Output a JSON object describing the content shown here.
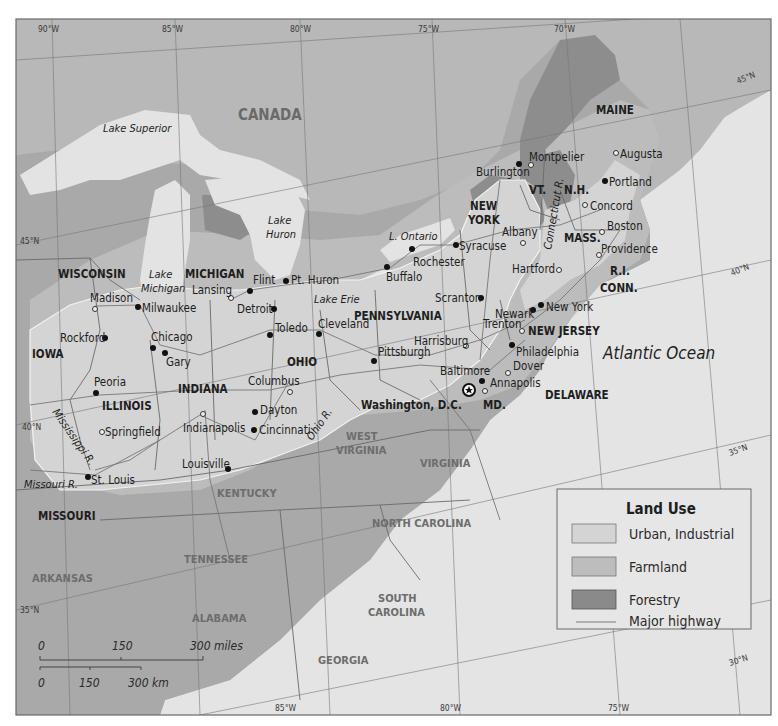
{
  "colors": {
    "land_canada": "#b7b7b7",
    "land_us": "#a9a9a9",
    "water": "#e3e3e3",
    "urban_industrial": "#d4d4d4",
    "farmland": "#bdbdbd",
    "forestry": "#8a8a8a",
    "highway": "#7a7a7a",
    "border": "#555555"
  },
  "grid_labels": {
    "top": [
      "90°W",
      "85°W",
      "80°W",
      "75°W",
      "70°W"
    ],
    "bottom": [
      "85°W",
      "80°W",
      "75°W"
    ],
    "lat_left": [
      "45°N",
      "40°N",
      "35°N"
    ],
    "lat_right": [
      "45°N",
      "40°N",
      "35°N",
      "30°N"
    ]
  },
  "regions": {
    "country": "CANADA",
    "ocean": "Atlantic Ocean"
  },
  "water_labels": {
    "lake_superior": "Lake Superior",
    "lake_huron_1": "Lake",
    "lake_huron_2": "Huron",
    "lake_michigan_1": "Lake",
    "lake_michigan_2": "Michigan",
    "lake_erie": "Lake Erie",
    "lake_ontario": "L. Ontario",
    "mississippi": "Mississippi R.",
    "missouri": "Missouri R.",
    "ohio": "Ohio R.",
    "connecticut": "Connecticut R."
  },
  "states": {
    "maine": "MAINE",
    "vt": "VT.",
    "nh": "N.H.",
    "new_york_1": "NEW",
    "new_york_2": "YORK",
    "mass": "MASS.",
    "ri": "R.I.",
    "conn": "CONN.",
    "wisconsin": "WISCONSIN",
    "michigan": "MICHIGAN",
    "pennsylvania": "PENNSYLVANIA",
    "new_jersey": "NEW JERSEY",
    "iowa": "IOWA",
    "ohio": "OHIO",
    "indiana": "INDIANA",
    "illinois": "ILLINOIS",
    "md": "MD.",
    "delaware": "DELAWARE",
    "west_virginia_1": "WEST",
    "west_virginia_2": "VIRGINIA",
    "virginia": "VIRGINIA",
    "kentucky": "KENTUCKY",
    "missouri": "MISSOURI",
    "north_carolina": "NORTH CAROLINA",
    "tennessee": "TENNESSEE",
    "arkansas": "ARKANSAS",
    "south_carolina_1": "SOUTH",
    "south_carolina_2": "CAROLINA",
    "alabama": "ALABAMA",
    "georgia": "GEORGIA"
  },
  "cities": {
    "montpelier": "Montpelier",
    "augusta": "Augusta",
    "burlington": "Burlington",
    "portland": "Portland",
    "concord": "Concord",
    "albany": "Albany",
    "boston": "Boston",
    "syracuse": "Syracuse",
    "rochester": "Rochester",
    "providence": "Providence",
    "buffalo": "Buffalo",
    "hartford": "Hartford",
    "flint": "Flint",
    "pt_huron": "Pt. Huron",
    "madison": "Madison",
    "lansing": "Lansing",
    "milwaukee": "Milwaukee",
    "detroit": "Detroit",
    "scranton": "Scranton",
    "newark": "Newark",
    "new_york": "New York",
    "trenton": "Trenton",
    "toledo": "Toledo",
    "cleveland": "Cleveland",
    "rockford": "Rockford",
    "chicago": "Chicago",
    "gary": "Gary",
    "harrisburg": "Harrisburg",
    "philadelphia": "Philadelphia",
    "pittsburgh": "Pittsburgh",
    "columbus": "Columbus",
    "baltimore": "Baltimore",
    "annapolis": "Annapolis",
    "dover": "Dover",
    "peoria": "Peoria",
    "washington_dc": "Washington, D.C.",
    "dayton": "Dayton",
    "springfield": "Springfield",
    "indianapolis": "Indianapolis",
    "cincinnati": "Cincinnati",
    "louisville": "Louisville",
    "st_louis": "St. Louis"
  },
  "legend": {
    "title": "Land Use",
    "items": [
      {
        "label": "Urban, Industrial",
        "swatch": "#d4d4d4"
      },
      {
        "label": "Farmland",
        "swatch": "#bdbdbd"
      },
      {
        "label": "Forestry",
        "swatch": "#8a8a8a"
      },
      {
        "label": "Major highway",
        "swatch": "line"
      }
    ]
  },
  "scale_bar": {
    "miles": {
      "labels": [
        "0",
        "150",
        "300 miles"
      ]
    },
    "km": {
      "labels": [
        "0",
        "150",
        "300 km"
      ]
    }
  }
}
